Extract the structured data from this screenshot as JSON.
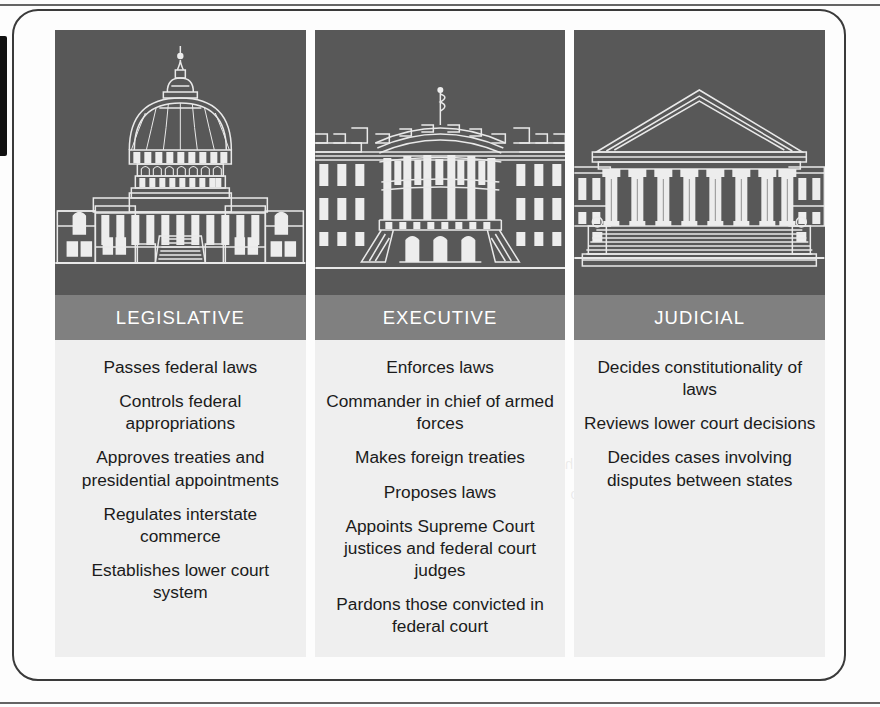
{
  "figure": {
    "accent_dark": "#585858",
    "accent_label_band": "#808080",
    "panel_background": "#efefef",
    "columns": [
      {
        "id": "legislative",
        "label": "LEGISLATIVE",
        "illustration_name": "us-capitol-building-illustration",
        "duties": [
          "Passes federal laws",
          "Controls federal appropriations",
          "Approves treaties and presidential appointments",
          "Regulates interstate commerce",
          "Establishes lower court system"
        ]
      },
      {
        "id": "executive",
        "label": "EXECUTIVE",
        "illustration_name": "white-house-building-illustration",
        "duties": [
          "Enforces laws",
          "Commander in chief of armed forces",
          "Makes foreign treaties",
          "Proposes laws",
          "Appoints Supreme Court justices and federal court judges",
          "Pardons those convicted in federal court"
        ]
      },
      {
        "id": "judicial",
        "label": "JUDICIAL",
        "illustration_name": "supreme-court-building-illustration",
        "duties": [
          "Decides constitutionality of laws",
          "Reviews lower court decisions",
          "Decides cases involving disputes between states"
        ]
      }
    ]
  }
}
